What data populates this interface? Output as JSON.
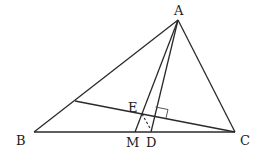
{
  "diagram": {
    "type": "geometry",
    "points": {
      "A": {
        "label": "A",
        "x": 178,
        "y": 20
      },
      "B": {
        "label": "B",
        "x": 34,
        "y": 132
      },
      "C": {
        "label": "C",
        "x": 235,
        "y": 132
      },
      "M": {
        "label": "M",
        "x": 135,
        "y": 132
      },
      "D": {
        "label": "D",
        "x": 151,
        "y": 132
      },
      "E": {
        "label": "E",
        "x": 142,
        "y": 114
      },
      "F": {
        "label": "",
        "x": 75,
        "y": 101
      }
    },
    "segments": [
      [
        "A",
        "B"
      ],
      [
        "A",
        "C"
      ],
      [
        "B",
        "C"
      ],
      [
        "A",
        "M"
      ],
      [
        "A",
        "D"
      ],
      [
        "C",
        "F"
      ]
    ],
    "dashed_segments": [
      [
        "E",
        "D"
      ]
    ],
    "right_angle": {
      "at": "intersection of AD and CF"
    },
    "labels": {
      "A": "A",
      "B": "B",
      "C": "C",
      "M": "M",
      "D": "D",
      "E": "E"
    }
  }
}
